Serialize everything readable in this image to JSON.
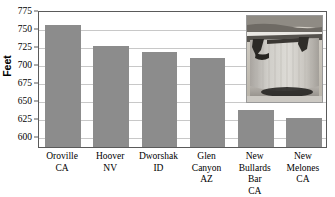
{
  "chart_data": {
    "type": "bar",
    "title": "",
    "xlabel": "",
    "ylabel": "Feet",
    "ylim": [
      585,
      775
    ],
    "yticks": [
      600,
      625,
      650,
      675,
      700,
      725,
      750,
      775
    ],
    "grid": true,
    "legend": "none",
    "bar_color": "#8c8c8c",
    "categories": [
      "Oroville CA",
      "Hoover NV",
      "Dworshak ID",
      "Glen Canyon AZ",
      "New Bullards Bar CA",
      "New Melones CA"
    ],
    "category_lines": [
      [
        "Oroville",
        "CA"
      ],
      [
        "Hoover",
        "NV"
      ],
      [
        "Dworshak",
        "ID"
      ],
      [
        "Glen",
        "Canyon",
        "AZ"
      ],
      [
        "New",
        "Bullards Bar",
        "CA"
      ],
      [
        "New",
        "Melones",
        "CA"
      ]
    ],
    "values": [
      754,
      725,
      717,
      709,
      637,
      625
    ]
  },
  "axis": {
    "y_title": "Feet",
    "tick_labels": [
      "775",
      "750",
      "725",
      "700",
      "675",
      "650",
      "625",
      "600"
    ]
  },
  "inset": {
    "caption": "dam-photograph"
  }
}
